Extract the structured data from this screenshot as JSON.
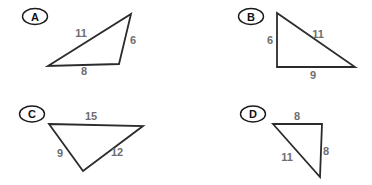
{
  "figures": [
    {
      "label": "A",
      "sides": [
        "11",
        "6",
        "8"
      ]
    },
    {
      "label": "B",
      "sides": [
        "6",
        "11",
        "9"
      ]
    },
    {
      "label": "C",
      "sides": [
        "15",
        "9",
        "12"
      ]
    },
    {
      "label": "D",
      "sides": [
        "8",
        "8",
        "11"
      ]
    }
  ],
  "colors": {
    "line": "#2b2b2b",
    "side_label": "#6e6e6e",
    "figure_label": "#111111",
    "background": "#ffffff"
  }
}
